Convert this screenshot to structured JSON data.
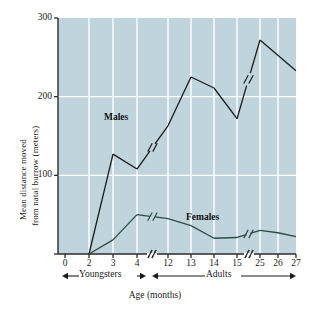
{
  "chart_data": {
    "type": "line",
    "title": "",
    "xlabel": "Age (months)",
    "ylabel": "Mean distance moved from natal burrow (meters)",
    "ylabel_line1": "Mean distance moved",
    "ylabel_line2": "from natal burrow (meters)",
    "ylim": [
      0,
      300
    ],
    "yticks": [
      0,
      100,
      200,
      300
    ],
    "ytick_labels": [
      "",
      "100",
      "200",
      "300"
    ],
    "xtick_labels": [
      "0",
      "2",
      "3",
      "4",
      "12",
      "13",
      "14",
      "15",
      "25",
      "26",
      "27"
    ],
    "axis_breaks": [
      "between 4 and 12",
      "between 15 and 25"
    ],
    "grid": true,
    "grid_color": "#ffffff",
    "plot_background": "#bfd4dc",
    "legend_position": "inline-labels",
    "series": [
      {
        "name": "Males",
        "color": "#1c1c1c",
        "label_text": "Males",
        "has_line_break": true,
        "breaks_after_x": [
          "4",
          "15"
        ],
        "points": [
          {
            "x": "2",
            "y": 0
          },
          {
            "x": "3",
            "y": 127
          },
          {
            "x": "4",
            "y": 108
          },
          {
            "x": "12",
            "y": 163
          },
          {
            "x": "13",
            "y": 225
          },
          {
            "x": "14",
            "y": 211
          },
          {
            "x": "15",
            "y": 172
          },
          {
            "x": "25",
            "y": 272
          },
          {
            "x": "27",
            "y": 233
          }
        ]
      },
      {
        "name": "Females",
        "color": "#2e4b46",
        "label_text": "Females",
        "has_line_break": true,
        "breaks_after_x": [
          "4",
          "15"
        ],
        "points": [
          {
            "x": "2",
            "y": 0
          },
          {
            "x": "3",
            "y": 18
          },
          {
            "x": "4",
            "y": 50
          },
          {
            "x": "12",
            "y": 45
          },
          {
            "x": "13",
            "y": 36
          },
          {
            "x": "14",
            "y": 20
          },
          {
            "x": "15",
            "y": 21
          },
          {
            "x": "25",
            "y": 30
          },
          {
            "x": "26",
            "y": 27
          },
          {
            "x": "27",
            "y": 22
          }
        ]
      }
    ],
    "annotations": [
      {
        "name": "youngsters-bracket",
        "text": "Youngsters"
      },
      {
        "name": "adults-bracket",
        "text": "Adults"
      }
    ]
  }
}
